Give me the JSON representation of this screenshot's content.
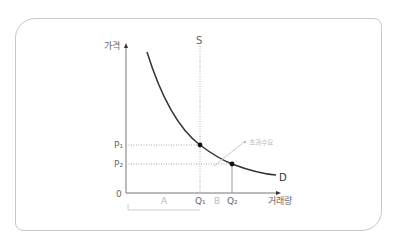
{
  "diagram": {
    "y_axis_label": "가격",
    "x_axis_label": "거래량",
    "origin_label": "0",
    "supply_label": "S",
    "demand_label": "D",
    "price_labels": [
      "P₁",
      "P₂"
    ],
    "quantity_labels": [
      "Q₁",
      "Q₂"
    ],
    "area_labels": [
      "A",
      "B"
    ],
    "annotation": "초과수요",
    "colors": {
      "curve": "#333333",
      "axis": "#777777",
      "guide": "#aaaaaa",
      "frame": "#c8c8c8",
      "annotation": "#bbbbbb"
    }
  }
}
